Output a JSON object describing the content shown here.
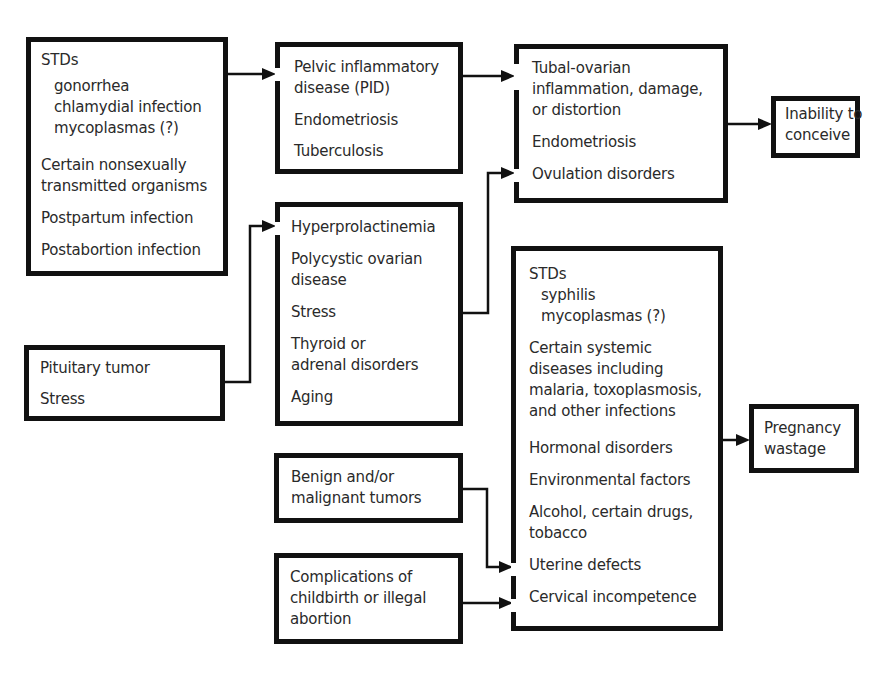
{
  "diagram": {
    "title": "",
    "boxes": {
      "stds_infertility": {
        "heading": "STDs",
        "sub": [
          "gonorrhea",
          "chlamydial infection",
          "mycoplasmas (?)"
        ],
        "items": [
          "Certain nonsexually",
          "transmitted organisms",
          "Postpartum infection",
          "Postabortion infection"
        ]
      },
      "pid": {
        "items": [
          "Pelvic inflammatory",
          "disease (PID)",
          "Endometriosis",
          "Tuberculosis"
        ]
      },
      "tubal": {
        "items": [
          "Tubal-ovarian",
          "inflammation, damage,",
          "or distortion",
          "Endometriosis",
          "Ovulation disorders"
        ]
      },
      "inability": {
        "items": [
          "Inability to",
          "conceive"
        ]
      },
      "hormonal": {
        "items": [
          "Hyperprolactinemia",
          "Polycystic ovarian",
          "disease",
          "Stress",
          "Thyroid or",
          "adrenal disorders",
          "Aging"
        ]
      },
      "pituitary": {
        "items": [
          "Pituitary tumor",
          "Stress"
        ]
      },
      "stds_pregnancy": {
        "heading": "STDs",
        "sub": [
          "syphilis",
          "mycoplasmas (?)"
        ],
        "items": [
          "Certain systemic",
          "diseases including",
          "malaria, toxoplasmosis,",
          "and other infections",
          "Hormonal disorders",
          "Environmental factors",
          "Alcohol, certain drugs,",
          "tobacco",
          "Uterine defects",
          "Cervical incompetence"
        ]
      },
      "wastage": {
        "items": [
          "Pregnancy",
          "wastage"
        ]
      },
      "tumors": {
        "items": [
          "Benign and/or",
          "malignant tumors"
        ]
      },
      "complications": {
        "items": [
          "Complications of",
          "childbirth or illegal",
          "abortion"
        ]
      }
    },
    "edges": [
      {
        "from": "stds_infertility",
        "to": "pid"
      },
      {
        "from": "pid",
        "to": "tubal"
      },
      {
        "from": "tubal",
        "to": "inability"
      },
      {
        "from": "pituitary",
        "to": "hormonal"
      },
      {
        "from": "hormonal",
        "to": "tubal"
      },
      {
        "from": "stds_pregnancy",
        "to": "wastage"
      },
      {
        "from": "tumors",
        "to": "stds_pregnancy"
      },
      {
        "from": "complications",
        "to": "stds_pregnancy"
      }
    ]
  }
}
